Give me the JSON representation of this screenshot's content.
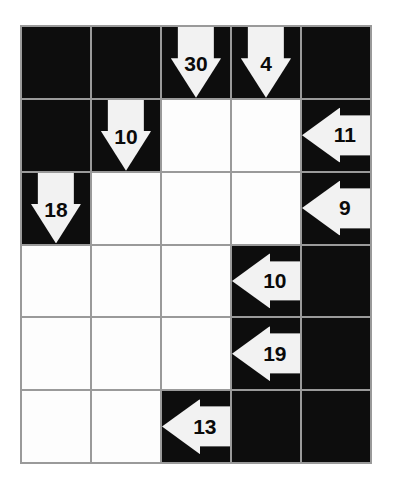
{
  "puzzle": {
    "type": "kakuro-arrow-grid",
    "rows": 6,
    "columns": 5,
    "colors": {
      "block": "#0d0d0d",
      "cell": "#fdfdfd",
      "gridline": "#9a9a9a",
      "arrow": "#f2f2f2",
      "number": "#0a0a0a",
      "background": "#ffffff"
    },
    "grid": [
      [
        {
          "kind": "block",
          "name": "cell-r1c1"
        },
        {
          "kind": "block",
          "name": "cell-r1c2"
        },
        {
          "kind": "clue",
          "direction": "down",
          "value": "30",
          "name": "clue-down-30"
        },
        {
          "kind": "clue",
          "direction": "down",
          "value": "4",
          "name": "clue-down-4"
        },
        {
          "kind": "block",
          "name": "cell-r1c5"
        }
      ],
      [
        {
          "kind": "block",
          "name": "cell-r2c1"
        },
        {
          "kind": "clue",
          "direction": "down",
          "value": "10",
          "name": "clue-down-10"
        },
        {
          "kind": "white",
          "name": "cell-r2c3"
        },
        {
          "kind": "white",
          "name": "cell-r2c4"
        },
        {
          "kind": "clue",
          "direction": "left",
          "value": "11",
          "name": "clue-left-11"
        }
      ],
      [
        {
          "kind": "clue",
          "direction": "down",
          "value": "18",
          "name": "clue-down-18"
        },
        {
          "kind": "white",
          "name": "cell-r3c2"
        },
        {
          "kind": "white",
          "name": "cell-r3c3"
        },
        {
          "kind": "white",
          "name": "cell-r3c4"
        },
        {
          "kind": "clue",
          "direction": "left",
          "value": "9",
          "name": "clue-left-9"
        }
      ],
      [
        {
          "kind": "white",
          "name": "cell-r4c1"
        },
        {
          "kind": "white",
          "name": "cell-r4c2"
        },
        {
          "kind": "white",
          "name": "cell-r4c3"
        },
        {
          "kind": "clue",
          "direction": "left",
          "value": "10",
          "name": "clue-left-10"
        },
        {
          "kind": "block",
          "name": "cell-r4c5"
        }
      ],
      [
        {
          "kind": "white",
          "name": "cell-r5c1"
        },
        {
          "kind": "white",
          "name": "cell-r5c2"
        },
        {
          "kind": "white",
          "name": "cell-r5c3"
        },
        {
          "kind": "clue",
          "direction": "left",
          "value": "19",
          "name": "clue-left-19"
        },
        {
          "kind": "block",
          "name": "cell-r5c5"
        }
      ],
      [
        {
          "kind": "white",
          "name": "cell-r6c1"
        },
        {
          "kind": "white",
          "name": "cell-r6c2"
        },
        {
          "kind": "clue",
          "direction": "left",
          "value": "13",
          "name": "clue-left-13"
        },
        {
          "kind": "block",
          "name": "cell-r6c4"
        },
        {
          "kind": "block",
          "name": "cell-r6c5"
        }
      ]
    ]
  }
}
